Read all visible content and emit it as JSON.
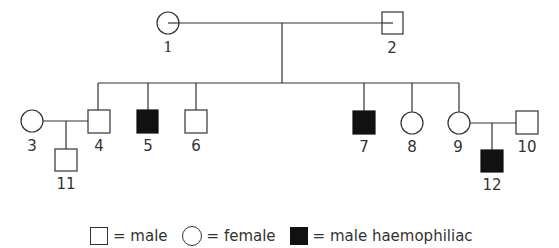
{
  "diagram": {
    "type": "pedigree",
    "trait": "haemophilia",
    "individuals": [
      {
        "id": "1",
        "sex": "female",
        "affected": false,
        "generation": 1
      },
      {
        "id": "2",
        "sex": "male",
        "affected": false,
        "generation": 1
      },
      {
        "id": "3",
        "sex": "female",
        "affected": false,
        "generation": 2
      },
      {
        "id": "4",
        "sex": "male",
        "affected": false,
        "generation": 2
      },
      {
        "id": "5",
        "sex": "male",
        "affected": true,
        "generation": 2
      },
      {
        "id": "6",
        "sex": "male",
        "affected": false,
        "generation": 2
      },
      {
        "id": "7",
        "sex": "male",
        "affected": true,
        "generation": 2
      },
      {
        "id": "8",
        "sex": "female",
        "affected": false,
        "generation": 2
      },
      {
        "id": "9",
        "sex": "female",
        "affected": false,
        "generation": 2
      },
      {
        "id": "10",
        "sex": "male",
        "affected": false,
        "generation": 2
      },
      {
        "id": "11",
        "sex": "male",
        "affected": false,
        "generation": 3
      },
      {
        "id": "12",
        "sex": "male",
        "affected": true,
        "generation": 3
      }
    ],
    "matings": [
      {
        "parents": [
          "1",
          "2"
        ],
        "children": [
          "4",
          "5",
          "6",
          "7",
          "8",
          "9"
        ]
      },
      {
        "parents": [
          "3",
          "4"
        ],
        "children": [
          "11"
        ]
      },
      {
        "parents": [
          "9",
          "10"
        ],
        "children": [
          "12"
        ]
      }
    ],
    "labels": {
      "n1": "1",
      "n2": "2",
      "n3": "3",
      "n4": "4",
      "n5": "5",
      "n6": "6",
      "n7": "7",
      "n8": "8",
      "n9": "9",
      "n10": "10",
      "n11": "11",
      "n12": "12"
    }
  },
  "legend": {
    "male": "= male",
    "female": "= female",
    "affected_male": "= male haemophiliac"
  },
  "colors": {
    "line": "#333333",
    "affected_fill": "#111111",
    "background": "#ffffff"
  }
}
